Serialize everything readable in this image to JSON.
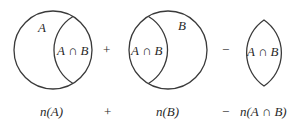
{
  "diagram": {
    "panels": [
      {
        "region_label": "A",
        "intersection_label": "A ∩ B",
        "caption": "n(A)"
      },
      {
        "region_label": "B",
        "intersection_label": "A ∩ B",
        "caption": "n(B)"
      },
      {
        "intersection_label": "A ∩ B",
        "caption": "n(A ∩ B)"
      }
    ],
    "operators": {
      "first": "+",
      "second": "−"
    },
    "caption_operators": {
      "first": "+",
      "second": "−"
    },
    "colors": {
      "stroke": "#3a3a3a",
      "text": "#2a2a2a",
      "background": "#ffffff"
    }
  }
}
